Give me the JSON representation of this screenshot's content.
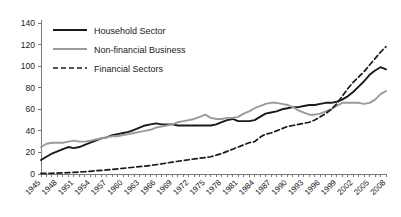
{
  "chart_data": {
    "type": "line",
    "title": "",
    "xlabel": "",
    "ylabel": "",
    "ylim": [
      0,
      140
    ],
    "xlim": [
      1945,
      2008
    ],
    "ytick_labels": [
      "0",
      "20",
      "40",
      "60",
      "80",
      "100",
      "120",
      "140"
    ],
    "yticks": [
      0,
      20,
      40,
      60,
      80,
      100,
      120,
      140
    ],
    "xtick_labels": [
      "1945",
      "1948",
      "1951",
      "1954",
      "1957",
      "1960",
      "1963",
      "1966",
      "1969",
      "1972",
      "1975",
      "1978",
      "1981",
      "1984",
      "1987",
      "1990",
      "1993",
      "1996",
      "1999",
      "2002",
      "2005",
      "2008"
    ],
    "xticks": [
      1945,
      1948,
      1951,
      1954,
      1957,
      1960,
      1963,
      1966,
      1969,
      1972,
      1975,
      1978,
      1981,
      1984,
      1987,
      1990,
      1993,
      1996,
      1999,
      2002,
      2005,
      2008
    ],
    "grid": false,
    "legend_position": "top-left",
    "x": [
      1945,
      1946,
      1947,
      1948,
      1949,
      1950,
      1951,
      1952,
      1953,
      1954,
      1955,
      1956,
      1957,
      1958,
      1959,
      1960,
      1961,
      1962,
      1963,
      1964,
      1965,
      1966,
      1967,
      1968,
      1969,
      1970,
      1971,
      1972,
      1973,
      1974,
      1975,
      1976,
      1977,
      1978,
      1979,
      1980,
      1981,
      1982,
      1983,
      1984,
      1985,
      1986,
      1987,
      1988,
      1989,
      1990,
      1991,
      1992,
      1993,
      1994,
      1995,
      1996,
      1997,
      1998,
      1999,
      2000,
      2001,
      2002,
      2003,
      2004,
      2005,
      2006,
      2007,
      2008
    ],
    "series": [
      {
        "name": "Household Sector",
        "style": "solid",
        "color": "#1a1a1a",
        "width": 1.9,
        "values": [
          13,
          16,
          19,
          21,
          23,
          25,
          24,
          25,
          27,
          29,
          31,
          33,
          34,
          36,
          37,
          38,
          39,
          41,
          43,
          45,
          46,
          47,
          46,
          46,
          46,
          45,
          45,
          45,
          45,
          45,
          45,
          45,
          46,
          48,
          50,
          51,
          49,
          49,
          49,
          50,
          53,
          56,
          57,
          58,
          60,
          61,
          62,
          62,
          63,
          64,
          64,
          65,
          66,
          66,
          67,
          69,
          72,
          76,
          81,
          86,
          92,
          96,
          99,
          97
        ]
      },
      {
        "name": "Non-financial Business",
        "style": "solid",
        "color": "#9a9a9a",
        "width": 1.9,
        "values": [
          25,
          28,
          29,
          29,
          29,
          30,
          31,
          30,
          30,
          31,
          32,
          33,
          34,
          35,
          35,
          36,
          37,
          38,
          39,
          40,
          41,
          43,
          44,
          45,
          46,
          48,
          49,
          50,
          51,
          53,
          55,
          52,
          51,
          51,
          52,
          52,
          53,
          56,
          58,
          61,
          63,
          65,
          66,
          66,
          65,
          64,
          62,
          59,
          57,
          55,
          55,
          56,
          58,
          60,
          63,
          66,
          66,
          66,
          66,
          65,
          66,
          69,
          74,
          77
        ]
      },
      {
        "name": "Financial Sectors",
        "style": "dashed",
        "color": "#1a1a1a",
        "width": 1.7,
        "values": [
          0.5,
          0.6,
          0.7,
          0.8,
          1,
          1.2,
          1.5,
          1.8,
          2.1,
          2.5,
          3,
          3.4,
          3.8,
          4.2,
          4.8,
          5.3,
          5.8,
          6.3,
          6.8,
          7.3,
          7.9,
          8.6,
          9.4,
          10.2,
          11,
          11.8,
          12.5,
          13.2,
          14,
          14.6,
          15.2,
          16,
          17.5,
          19,
          21,
          23,
          25,
          27,
          29,
          30,
          34,
          37,
          38,
          40,
          42,
          44,
          45,
          46,
          47,
          48,
          50,
          53,
          56,
          60,
          65,
          72,
          79,
          85,
          90,
          95,
          101,
          107,
          113,
          118
        ]
      }
    ]
  },
  "legend": {
    "items": [
      {
        "label": "Household Sector",
        "style": "solid",
        "color": "#1a1a1a"
      },
      {
        "label": "Non-financial Business",
        "style": "solid",
        "color": "#9a9a9a"
      },
      {
        "label": "Financial Sectors",
        "style": "dashed",
        "color": "#1a1a1a"
      }
    ]
  }
}
